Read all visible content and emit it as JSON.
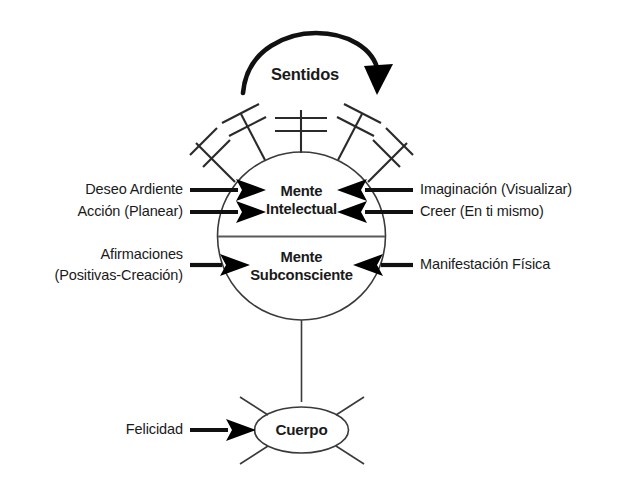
{
  "diagram": {
    "title_flow": "Sentidos",
    "center": {
      "upper_label_line1": "Mente",
      "upper_label_line2": "Intelectual",
      "lower_label_line1": "Mente",
      "lower_label_line2": "Subconsciente"
    },
    "body": {
      "label": "Cuerpo"
    },
    "inputs_left": [
      {
        "name": "deseo-ardiente",
        "text": "Deseo Ardiente",
        "target": "Mente Intelectual"
      },
      {
        "name": "accion-planear",
        "text": "Acción (Planear)",
        "target": "Mente Intelectual"
      },
      {
        "name": "afirmaciones",
        "line1": "Afirmaciones",
        "line2": "(Positivas-Creación)",
        "target": "Mente Subconsciente"
      }
    ],
    "inputs_right": [
      {
        "name": "imaginacion-visualizar",
        "text": "Imaginación (Visualizar)",
        "target": "Mente Intelectual"
      },
      {
        "name": "creer-en-ti-mismo",
        "text": "Creer (En ti mismo)",
        "target": "Mente Intelectual"
      },
      {
        "name": "manifestacion-fisica",
        "text": "Manifestación Física",
        "target": "Mente Subconsciente"
      }
    ],
    "inputs_body": [
      {
        "name": "felicidad",
        "text": "Felicidad",
        "target": "Cuerpo"
      }
    ],
    "colors": {
      "background": "#ffffff",
      "ink": "#1a1a1a",
      "outline": "#3a3a3a",
      "divider": "#5a5a5a",
      "arrow": "#000000"
    }
  }
}
